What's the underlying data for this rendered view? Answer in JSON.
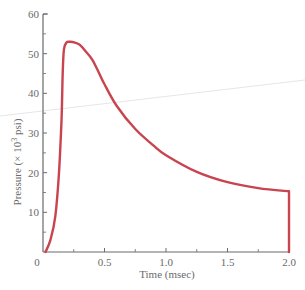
{
  "chart_data": {
    "type": "line",
    "title": "",
    "xlabel": "Time (msec)",
    "ylabel": "Pressure (× 10³ psi)",
    "xlim": [
      0,
      2.0
    ],
    "ylim": [
      0,
      60
    ],
    "xticks": [
      0,
      0.5,
      1.0,
      1.5,
      2.0
    ],
    "xtick_labels": [
      "0",
      "0.5",
      "1.0",
      "1.5",
      "2.0"
    ],
    "xminor_ticks": [
      0.25,
      0.75,
      1.25,
      1.75
    ],
    "yticks": [
      10,
      20,
      30,
      40,
      50,
      60
    ],
    "ytick_labels": [
      "10",
      "20",
      "30",
      "40",
      "50",
      "60"
    ],
    "yminor_ticks": [
      5,
      15,
      25,
      35,
      45,
      55
    ],
    "grid": false,
    "legend": null,
    "series": [
      {
        "name": "Pressure",
        "color": "#c8444f",
        "x": [
          0.02,
          0.06,
          0.1,
          0.13,
          0.15,
          0.16,
          0.17,
          0.19,
          0.22,
          0.26,
          0.3,
          0.35,
          0.4,
          0.45,
          0.5,
          0.6,
          0.75,
          0.9,
          1.0,
          1.25,
          1.5,
          1.75,
          2.0,
          2.0
        ],
        "y": [
          0,
          3,
          9,
          20,
          33,
          45,
          51,
          52.8,
          53.0,
          52.8,
          52.2,
          50.5,
          48.5,
          45.5,
          42.3,
          36.8,
          31.0,
          26.8,
          24.4,
          20.2,
          17.6,
          16.1,
          15.3,
          0
        ]
      }
    ]
  },
  "labels": {
    "xlabel": "Time (msec)",
    "ylabel_main": "Pressure (× 10",
    "ylabel_sup": "3",
    "ylabel_tail": " psi)",
    "origin": "0"
  }
}
